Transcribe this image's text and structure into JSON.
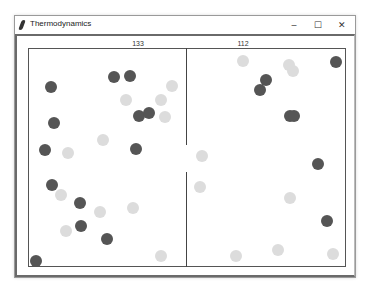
{
  "window": {
    "title": "Thermodynamics",
    "controls": {
      "minimize": "–",
      "maximize": "☐",
      "close": "✕"
    }
  },
  "chambers": {
    "left": {
      "count_label": "133"
    },
    "right": {
      "count_label": "112"
    }
  },
  "colors": {
    "hot": "#dcdcdc",
    "cold": "#555555",
    "border": "#555555"
  },
  "balls": [
    {
      "x": 51,
      "y": 87,
      "t": "dark"
    },
    {
      "x": 114,
      "y": 77,
      "t": "dark"
    },
    {
      "x": 130,
      "y": 76,
      "t": "dark"
    },
    {
      "x": 126,
      "y": 100,
      "t": "light"
    },
    {
      "x": 172,
      "y": 86,
      "t": "light"
    },
    {
      "x": 161,
      "y": 100,
      "t": "light"
    },
    {
      "x": 139,
      "y": 116,
      "t": "dark"
    },
    {
      "x": 149,
      "y": 113,
      "t": "dark"
    },
    {
      "x": 165,
      "y": 117,
      "t": "light"
    },
    {
      "x": 54,
      "y": 123,
      "t": "dark"
    },
    {
      "x": 103,
      "y": 140,
      "t": "light"
    },
    {
      "x": 45,
      "y": 150,
      "t": "dark"
    },
    {
      "x": 68,
      "y": 153,
      "t": "light"
    },
    {
      "x": 136,
      "y": 149,
      "t": "dark"
    },
    {
      "x": 52,
      "y": 185,
      "t": "dark"
    },
    {
      "x": 61,
      "y": 195,
      "t": "light"
    },
    {
      "x": 80,
      "y": 203,
      "t": "dark"
    },
    {
      "x": 100,
      "y": 212,
      "t": "light"
    },
    {
      "x": 133,
      "y": 208,
      "t": "light"
    },
    {
      "x": 81,
      "y": 226,
      "t": "dark"
    },
    {
      "x": 66,
      "y": 231,
      "t": "light"
    },
    {
      "x": 107,
      "y": 239,
      "t": "dark"
    },
    {
      "x": 161,
      "y": 256,
      "t": "light"
    },
    {
      "x": 36,
      "y": 261,
      "t": "dark"
    },
    {
      "x": 243,
      "y": 61,
      "t": "light"
    },
    {
      "x": 289,
      "y": 65,
      "t": "light"
    },
    {
      "x": 293,
      "y": 71,
      "t": "light"
    },
    {
      "x": 336,
      "y": 62,
      "t": "dark"
    },
    {
      "x": 266,
      "y": 80,
      "t": "dark"
    },
    {
      "x": 260,
      "y": 90,
      "t": "dark"
    },
    {
      "x": 290,
      "y": 116,
      "t": "dark"
    },
    {
      "x": 294,
      "y": 116,
      "t": "dark"
    },
    {
      "x": 202,
      "y": 156,
      "t": "light"
    },
    {
      "x": 318,
      "y": 164,
      "t": "dark"
    },
    {
      "x": 200,
      "y": 187,
      "t": "light"
    },
    {
      "x": 290,
      "y": 198,
      "t": "light"
    },
    {
      "x": 327,
      "y": 221,
      "t": "dark"
    },
    {
      "x": 236,
      "y": 256,
      "t": "light"
    },
    {
      "x": 278,
      "y": 250,
      "t": "light"
    },
    {
      "x": 333,
      "y": 254,
      "t": "light"
    }
  ]
}
